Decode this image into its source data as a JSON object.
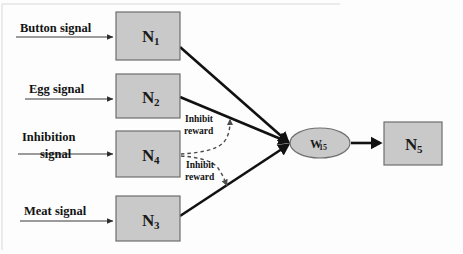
{
  "diagram": {
    "colors": {
      "node_fill": "#c9c9c9",
      "node_stroke": "#6e6e6e",
      "line": "#111111",
      "dashed_line": "#4d4d4d",
      "text": "#131313",
      "background": "#fdfdfd"
    },
    "input_signals": [
      {
        "id": "button",
        "label": "Button signal",
        "target": "N1"
      },
      {
        "id": "egg",
        "label": "Egg signal",
        "target": "N2"
      },
      {
        "id": "inhibition_line1",
        "label": "Inhibition",
        "line2": "signal",
        "target": "N4"
      },
      {
        "id": "meat",
        "label": "Meat signal",
        "target": "N3"
      }
    ],
    "nodes": [
      {
        "id": "N1",
        "label": "N",
        "subscript": "1"
      },
      {
        "id": "N2",
        "label": "N",
        "subscript": "2"
      },
      {
        "id": "N4",
        "label": "N",
        "subscript": "4"
      },
      {
        "id": "N3",
        "label": "N",
        "subscript": "3"
      },
      {
        "id": "N5",
        "label": "N",
        "subscript": "5"
      }
    ],
    "weight_node": {
      "id": "W15",
      "label": "W",
      "subscript": "15"
    },
    "inhibit_labels": [
      {
        "id": "inhibit_upper",
        "line1": "Inhibit",
        "line2": "reward"
      },
      {
        "id": "inhibit_lower",
        "line1": "Inhibit",
        "line2": "reward"
      }
    ],
    "output": {
      "from": "W15",
      "to": "N5"
    }
  }
}
